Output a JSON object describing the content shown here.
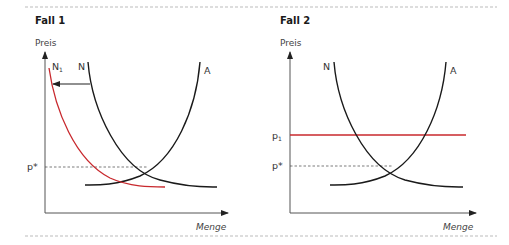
{
  "panels": [
    {
      "title": "Fall 1",
      "ylabel": "Preis",
      "xlabel": "Menge",
      "curves": {
        "demand": "N",
        "demand_shifted": "N",
        "demand_shifted_sub": "1",
        "supply": "A"
      },
      "price_labels": {
        "equilibrium": "p*"
      }
    },
    {
      "title": "Fall 2",
      "ylabel": "Preis",
      "xlabel": "Menge",
      "curves": {
        "demand": "N",
        "supply": "A"
      },
      "price_labels": {
        "fixed": "p",
        "fixed_sub": "1",
        "equilibrium": "p*"
      }
    }
  ],
  "colors": {
    "curve": "#1a1a1a",
    "highlight": "#c8282d",
    "axis": "#555555",
    "divider": "#aaaaaa"
  }
}
